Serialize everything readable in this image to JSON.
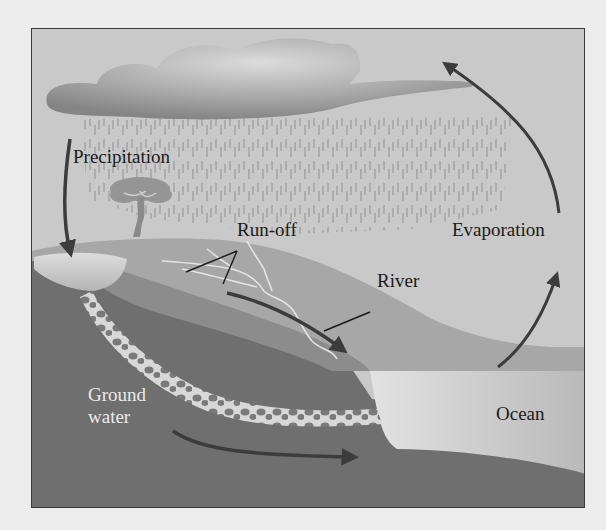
{
  "diagram": {
    "labels": {
      "precipitation": "Precipitation",
      "run_off": "Run-off",
      "evaporation": "Evaporation",
      "river": "River",
      "ground_water_line1": "Ground",
      "ground_water_line2": "water",
      "ocean": "Ocean"
    },
    "colors": {
      "page_background": "#ececec",
      "sky": "#c9c9c9",
      "cloud_light": "#d8d8d8",
      "cloud_dark": "#8a8a8a",
      "rain": "#8f8f8f",
      "hill_top": "#a8a8a8",
      "hill_slope": "#9a9a9a",
      "ground_dark": "#6f6f6f",
      "ocean": "#c2c2c2",
      "aquifer_light": "#d6d6d6",
      "arrow": "#3c3c3c",
      "frame": "#3a3a3a"
    }
  }
}
